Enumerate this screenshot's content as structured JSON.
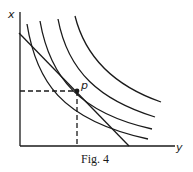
{
  "figure": {
    "caption": "Fig. 4",
    "x_axis_label": "y",
    "y_axis_label": "x",
    "point_label": "p",
    "ink_color": "#1a1a1a",
    "background": "#ffffff"
  },
  "diagram": {
    "type": "indifference-curves-with-budget-line",
    "axes": {
      "origin": [
        20,
        146
      ],
      "y_axis_top": [
        20,
        12
      ],
      "x_axis_right": [
        175,
        146
      ]
    },
    "curves": [
      {
        "name": "indifference-curve-1",
        "path": "M27,24 C36,80 60,120 148,139"
      },
      {
        "name": "indifference-curve-2",
        "path": "M40,21 C50,78 80,113 152,129"
      },
      {
        "name": "indifference-curve-3",
        "path": "M58,19 C68,72 100,100 155,117"
      },
      {
        "name": "indifference-curve-4",
        "path": "M75,16 C86,60 118,87 161,102"
      }
    ],
    "budget_line": {
      "from": [
        19,
        33
      ],
      "to": [
        129,
        146
      ]
    },
    "tangent_point": {
      "x": 77,
      "y": 91
    },
    "dashed_guides": {
      "horizontal": {
        "from": [
          20,
          91
        ],
        "to": [
          77,
          91
        ]
      },
      "vertical": {
        "from": [
          77,
          91
        ],
        "to": [
          77,
          146
        ]
      }
    }
  }
}
